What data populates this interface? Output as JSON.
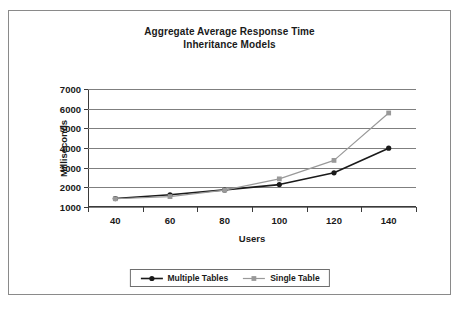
{
  "chart_data": {
    "type": "line",
    "title": "Aggregate Average Response Time Inheritance Models",
    "title_lines": [
      "Aggregate Average Response Time",
      "Inheritance Models"
    ],
    "xlabel": "Users",
    "ylabel": "Milliseconds",
    "categories": [
      40,
      60,
      80,
      100,
      120,
      140
    ],
    "xtick_labels": [
      "40",
      "60",
      "80",
      "100",
      "120",
      "140"
    ],
    "ytick_labels": [
      "1000",
      "2000",
      "3000",
      "4000",
      "5000",
      "6000",
      "7000"
    ],
    "yticks": [
      1000,
      2000,
      3000,
      4000,
      5000,
      6000,
      7000
    ],
    "ylim": [
      1000,
      7000
    ],
    "grid": "horizontal",
    "legend_position": "bottom-center",
    "series": [
      {
        "name": "Multiple Tables",
        "color": "#1a1a1a",
        "marker": "circle",
        "values": [
          1430,
          1620,
          1870,
          2140,
          2740,
          3990
        ]
      },
      {
        "name": "Single Table",
        "color": "#999999",
        "marker": "square",
        "values": [
          1420,
          1530,
          1860,
          2430,
          3370,
          5780
        ]
      }
    ]
  },
  "figure": {
    "border_color": "#8a8a8a",
    "background": "#ffffff"
  }
}
